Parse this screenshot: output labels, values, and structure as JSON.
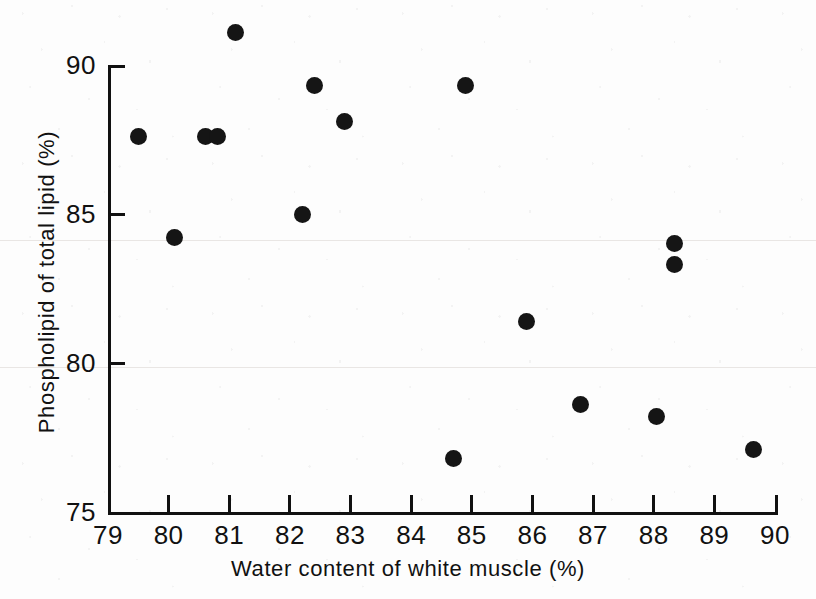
{
  "chart_data": {
    "type": "scatter",
    "title": "",
    "xlabel": "Water content of white muscle (%)",
    "ylabel": "Phospholipid of total lipid (%)",
    "xlim": [
      79,
      90
    ],
    "ylim": [
      75,
      90
    ],
    "xticks": [
      79,
      80,
      81,
      82,
      83,
      84,
      85,
      86,
      87,
      88,
      89,
      90
    ],
    "yticks": [
      75,
      80,
      85,
      90
    ],
    "xtick_labels": [
      "79",
      "80",
      "81",
      "82",
      "83",
      "84",
      "85",
      "86",
      "87",
      "88",
      "89",
      "90"
    ],
    "ytick_labels": [
      "75",
      "80",
      "85",
      "90"
    ],
    "grid": false,
    "legend": false,
    "marker": "filled-circle",
    "marker_color": "#151515",
    "axis_color": "#111111",
    "background_color": "#fdfdfd",
    "n_points": 18,
    "points": [
      {
        "x": 79.5,
        "y": 87.6
      },
      {
        "x": 80.1,
        "y": 84.2
      },
      {
        "x": 80.6,
        "y": 87.6
      },
      {
        "x": 80.8,
        "y": 87.6
      },
      {
        "x": 81.1,
        "y": 91.1
      },
      {
        "x": 82.2,
        "y": 85.0
      },
      {
        "x": 82.4,
        "y": 89.3
      },
      {
        "x": 82.9,
        "y": 88.1
      },
      {
        "x": 84.7,
        "y": 76.8
      },
      {
        "x": 84.9,
        "y": 89.3
      },
      {
        "x": 85.9,
        "y": 81.4
      },
      {
        "x": 86.8,
        "y": 78.6
      },
      {
        "x": 88.05,
        "y": 78.2
      },
      {
        "x": 88.35,
        "y": 84.0
      },
      {
        "x": 88.35,
        "y": 83.3
      },
      {
        "x": 89.65,
        "y": 77.1
      }
    ]
  },
  "axis_labels": {
    "x_title": "Water content of white muscle (%)",
    "y_title": "Phospholipid of total lipid (%)"
  }
}
